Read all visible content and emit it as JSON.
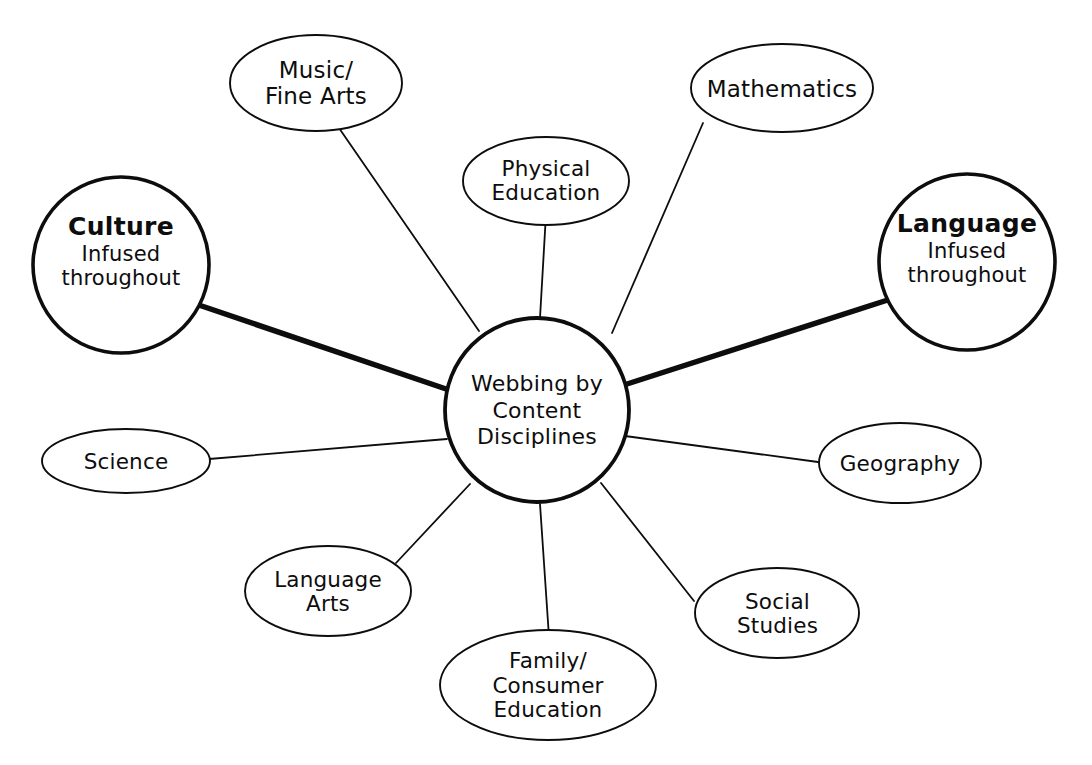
{
  "diagram": {
    "title": "Webbing by Content Disciplines",
    "type": "concept-web",
    "background_color": "#ffffff",
    "stroke_color": "#0d0d0d",
    "hub": {
      "name": "webbing-by-content-disciplines",
      "shape": "circle",
      "lines": [
        "Webbing by",
        "Content",
        "Disciplines"
      ]
    },
    "emphasis_nodes": [
      {
        "name": "culture",
        "shape": "circle",
        "title": "Culture",
        "subtitle_lines": [
          "Infused",
          "throughout"
        ],
        "connector": "thick"
      },
      {
        "name": "language",
        "shape": "circle",
        "title": "Language",
        "subtitle_lines": [
          "Infused",
          "throughout"
        ],
        "connector": "thick"
      }
    ],
    "discipline_nodes": [
      {
        "name": "music-fine-arts",
        "shape": "ellipse",
        "lines": [
          "Music/",
          "Fine Arts"
        ],
        "connector": "thin"
      },
      {
        "name": "physical-education",
        "shape": "ellipse",
        "lines": [
          "Physical",
          "Education"
        ],
        "connector": "thin"
      },
      {
        "name": "mathematics",
        "shape": "ellipse",
        "lines": [
          "Mathematics"
        ],
        "connector": "thin"
      },
      {
        "name": "geography",
        "shape": "ellipse",
        "lines": [
          "Geography"
        ],
        "connector": "thin"
      },
      {
        "name": "social-studies",
        "shape": "ellipse",
        "lines": [
          "Social",
          "Studies"
        ],
        "connector": "thin"
      },
      {
        "name": "family-consumer-education",
        "shape": "ellipse",
        "lines": [
          "Family/",
          "Consumer",
          "Education"
        ],
        "connector": "thin"
      },
      {
        "name": "language-arts",
        "shape": "ellipse",
        "lines": [
          "Language",
          "Arts"
        ],
        "connector": "thin"
      },
      {
        "name": "science",
        "shape": "ellipse",
        "lines": [
          "Science"
        ],
        "connector": "thin"
      }
    ]
  }
}
